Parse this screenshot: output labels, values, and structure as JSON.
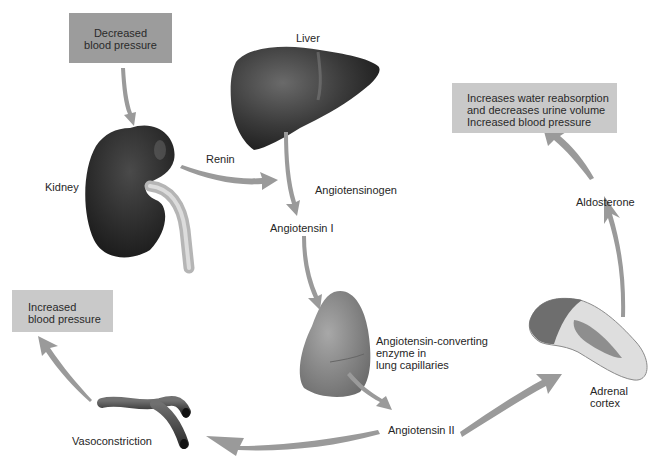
{
  "diagram": {
    "boxes": {
      "decreased_bp": {
        "lines": [
          "Decreased",
          "blood pressure"
        ]
      },
      "increased_bp_left": {
        "lines": [
          "Increased",
          "blood pressure"
        ]
      },
      "aldosterone_effect": {
        "lines": [
          "Increases water reabsorption",
          "and decreases urine volume",
          "Increased blood pressure"
        ]
      }
    },
    "labels": {
      "liver": "Liver",
      "kidney": "Kidney",
      "renin": "Renin",
      "angiotensinogen": "Angiotensinogen",
      "angiotensin_1": "Angiotensin I",
      "ace": [
        "Angiotensin-converting",
        "enzyme in",
        "lung capillaries"
      ],
      "angiotensin_2": "Angiotensin II",
      "vasoconstriction": "Vasoconstriction",
      "adrenal": [
        "Adrenal",
        "cortex"
      ],
      "aldosterone": "Aldosterone"
    },
    "flow": [
      {
        "from": "Decreased blood pressure",
        "to": "Kidney"
      },
      {
        "from": "Kidney",
        "to": "Angiotensinogen",
        "via": "Renin"
      },
      {
        "from": "Liver",
        "to": "Angiotensin I",
        "via": "Angiotensinogen"
      },
      {
        "from": "Angiotensin I",
        "to": "Lung capillaries"
      },
      {
        "from": "Lung capillaries",
        "to": "Angiotensin II",
        "via": "Angiotensin-converting enzyme"
      },
      {
        "from": "Angiotensin II",
        "to": "Vasoconstriction"
      },
      {
        "from": "Vasoconstriction",
        "to": "Increased blood pressure"
      },
      {
        "from": "Angiotensin II",
        "to": "Adrenal cortex"
      },
      {
        "from": "Adrenal cortex",
        "to": "Aldosterone"
      },
      {
        "from": "Aldosterone",
        "to": "Increases water reabsorption and decreases urine volume; Increased blood pressure"
      }
    ],
    "colors": {
      "box_dark": "#9c9c9c",
      "box_light": "#c9c9c9",
      "arrow": "#9a9a9a",
      "organ_dark": "#2e2e2e",
      "lung": "#8c8c8c"
    }
  }
}
